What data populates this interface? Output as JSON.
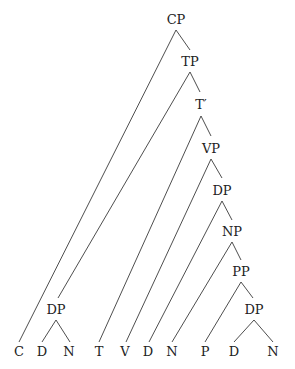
{
  "diagram": {
    "type": "syntax-tree",
    "nodes": {
      "cp": "CP",
      "tp": "TP",
      "tbar": "T′",
      "vp": "VP",
      "dp1": "DP",
      "np": "NP",
      "pp": "PP",
      "dp2": "DP",
      "dp_subj": "DP"
    },
    "leaves": [
      "C",
      "D",
      "N",
      "T",
      "V",
      "D",
      "N",
      "P",
      "D",
      "N"
    ],
    "edges": [
      [
        "CP",
        "C"
      ],
      [
        "CP",
        "TP"
      ],
      [
        "TP",
        "DP(subj)"
      ],
      [
        "TP",
        "T′"
      ],
      [
        "DP(subj)",
        "D"
      ],
      [
        "DP(subj)",
        "N"
      ],
      [
        "T′",
        "T"
      ],
      [
        "T′",
        "VP"
      ],
      [
        "VP",
        "V"
      ],
      [
        "VP",
        "DP"
      ],
      [
        "DP",
        "D"
      ],
      [
        "DP",
        "NP"
      ],
      [
        "NP",
        "N"
      ],
      [
        "NP",
        "PP"
      ],
      [
        "PP",
        "P"
      ],
      [
        "PP",
        "DP"
      ],
      [
        "DP",
        "D"
      ],
      [
        "DP",
        "N"
      ]
    ]
  }
}
